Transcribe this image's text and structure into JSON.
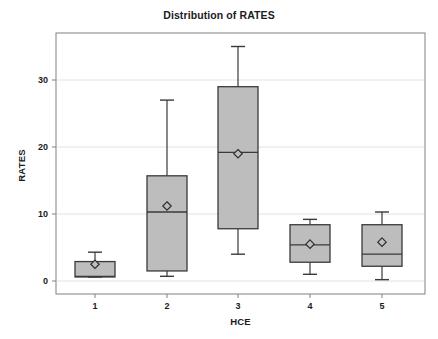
{
  "chart_data": {
    "type": "box",
    "title": "Distribution of RATES",
    "xlabel": "HCE",
    "ylabel": "RATES",
    "categories": [
      "1",
      "2",
      "3",
      "4",
      "5"
    ],
    "ylim": [
      -1.5,
      36.0
    ],
    "yticks": [
      0,
      10,
      20,
      30
    ],
    "ytick_labels": [
      "0",
      "10",
      "20",
      "30"
    ],
    "xticks": [
      1,
      2,
      3,
      4,
      5
    ],
    "grid": "horizontal",
    "legend": "none",
    "box_fill_color": "#bdbdbd",
    "box_line_color": "#3a3a3a",
    "mean_marker": "open-diamond",
    "boxes": [
      {
        "category": "1",
        "whisker_low": 0.6,
        "q1": 0.6,
        "median": 0.7,
        "q3": 2.9,
        "whisker_high": 4.3,
        "mean": 2.5
      },
      {
        "category": "2",
        "whisker_low": 0.7,
        "q1": 1.5,
        "median": 10.3,
        "q3": 15.7,
        "whisker_high": 27.0,
        "mean": 11.2
      },
      {
        "category": "3",
        "whisker_low": 4.0,
        "q1": 7.8,
        "median": 19.2,
        "q3": 29.0,
        "whisker_high": 35.0,
        "mean": 19.0
      },
      {
        "category": "4",
        "whisker_low": 1.0,
        "q1": 2.8,
        "median": 5.4,
        "q3": 8.4,
        "whisker_high": 9.2,
        "mean": 5.5
      },
      {
        "category": "5",
        "whisker_low": 0.2,
        "q1": 2.2,
        "median": 4.0,
        "q3": 8.4,
        "whisker_high": 10.3,
        "mean": 5.8
      }
    ]
  },
  "colors": {
    "background": "#ffffff",
    "frame": "#808080",
    "gridline": "#e2e2e2",
    "text": "#1b1b1b"
  }
}
